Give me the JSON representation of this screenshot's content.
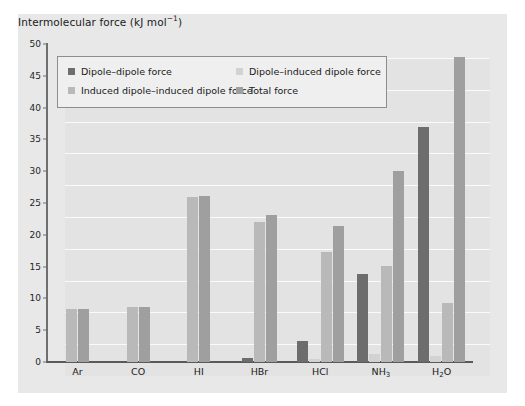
{
  "figure": {
    "title_main": "Intermolecular force (kJ mol",
    "title_sup": "−1",
    "title_tail": ")",
    "title_full": "Intermolecular force (kJ mol−1)"
  },
  "chart_data": {
    "type": "bar",
    "title": "Intermolecular force (kJ mol−1)",
    "xlabel": "",
    "ylabel": "Intermolecular force (kJ mol−1)",
    "ylim": [
      0,
      50
    ],
    "ytick_step": 5,
    "yticks": [
      "0",
      "5",
      "10",
      "15",
      "20",
      "25",
      "30",
      "35",
      "40",
      "45",
      "50"
    ],
    "grid": true,
    "grid_axis": "y",
    "legend_position": "upper-left-inside",
    "categories": [
      "Ar",
      "CO",
      "HI",
      "HBr",
      "HCl",
      "NH3",
      "H2O"
    ],
    "category_labels": [
      "Ar",
      "CO",
      "HI",
      "HBr",
      "HCl",
      "NH₃",
      "H₂O"
    ],
    "series": [
      {
        "name": "Dipole–dipole force",
        "color": "#6d6d6d",
        "values": [
          0,
          0,
          0,
          0.7,
          3.3,
          13.8,
          37.0
        ]
      },
      {
        "name": "Dipole–induced dipole force",
        "color": "#d2d2d2",
        "values": [
          0,
          0,
          0,
          0,
          0.5,
          1.3,
          1.0
        ]
      },
      {
        "name": "Induced dipole–induced dipole force",
        "color": "#b9b9b9",
        "values": [
          8.3,
          8.6,
          26.0,
          22.0,
          17.3,
          15.1,
          9.3
        ]
      },
      {
        "name": "Total force",
        "color": "#9f9f9f",
        "values": [
          8.3,
          8.7,
          26.1,
          23.1,
          21.4,
          30.0,
          48.0
        ]
      }
    ]
  },
  "legend": {
    "entries": [
      {
        "label": "Dipole–dipole force",
        "color": "#6d6d6d"
      },
      {
        "label": "Dipole–induced dipole force",
        "color": "#d2d2d2"
      },
      {
        "label": "Induced dipole–induced dipole force",
        "color": "#b9b9b9"
      },
      {
        "label": "Total force",
        "color": "#9f9f9f"
      }
    ]
  }
}
